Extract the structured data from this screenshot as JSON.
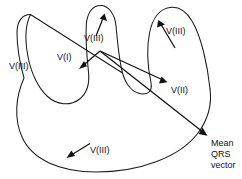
{
  "figure": {
    "background_color": "#ffffff",
    "stroke_color": "#1a1a1a"
  },
  "labels": {
    "lead3_left": "V(III)",
    "lead3_middle": "V(III)",
    "lead3_right": "V(III)",
    "lead3_bottom": "V(III)",
    "lead1": "V(I)",
    "lead2": "V(II)",
    "mean_line1": "Mean",
    "mean_line2": "QRS",
    "mean_line3": "vector"
  },
  "vectors": [
    {
      "name": "v-iii-middle",
      "label": "V(III)",
      "direction": "up-right",
      "origin": "middle-lobe"
    },
    {
      "name": "v-iii-right",
      "label": "V(III)",
      "direction": "up-left",
      "origin": "right-lobe"
    },
    {
      "name": "v-i",
      "label": "V(I)",
      "direction": "down-left",
      "origin": "hub"
    },
    {
      "name": "v-ii",
      "label": "V(II)",
      "direction": "down-right",
      "origin": "hub"
    },
    {
      "name": "mean-qrs",
      "label": "Mean QRS vector",
      "direction": "down-right-long",
      "origin": "hub"
    },
    {
      "name": "v-iii-bottom",
      "label": "V(III)",
      "direction": "down-left",
      "origin": "lower-body"
    }
  ]
}
